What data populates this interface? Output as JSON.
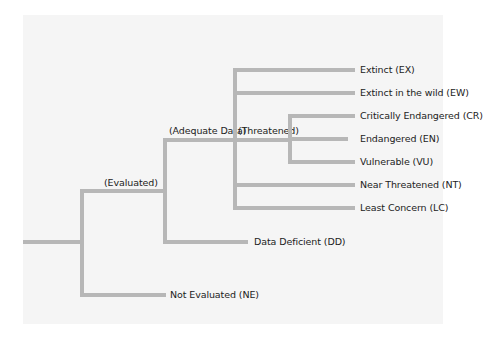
{
  "diagram": {
    "type": "tree",
    "colors": {
      "line": "#b7b7b7",
      "background": "#f5f5f5",
      "text": "#222222"
    },
    "branch_labels": {
      "evaluated": "(Evaluated)",
      "adequate_data": "(Adequate Data)",
      "threatened": "(Threatened)"
    },
    "leaves": {
      "extinct": "Extinct (EX)",
      "extinct_wild": "Extinct in the wild (EW)",
      "critically_endangered": "Critically Endangered (CR)",
      "endangered": "Endangered (EN)",
      "vulnerable": "Vulnerable (VU)",
      "near_threatened": "Near Threatened (NT)",
      "least_concern": "Least Concern (LC)",
      "data_deficient": "Data Deficient (DD)",
      "not_evaluated": "Not Evaluated (NE)"
    },
    "structure": {
      "root": [
        "(Evaluated)",
        "Not Evaluated (NE)"
      ],
      "(Evaluated)": [
        "(Adequate Data)",
        "Data Deficient (DD)"
      ],
      "(Adequate Data)": [
        "Extinct (EX)",
        "Extinct in the wild (EW)",
        "(Threatened)",
        "Near Threatened (NT)",
        "Least Concern (LC)"
      ],
      "(Threatened)": [
        "Critically Endangered (CR)",
        "Endangered (EN)",
        "Vulnerable (VU)"
      ]
    }
  }
}
